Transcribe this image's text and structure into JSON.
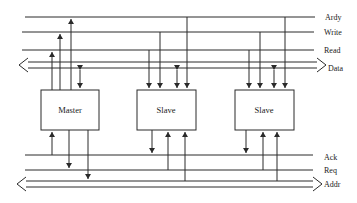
{
  "diagram": {
    "type": "bus-architecture",
    "signals": {
      "ardy": "Ardy",
      "write": "Write",
      "read": "Read",
      "data": "Data",
      "ack": "Ack",
      "req": "Req",
      "addr": "Addr"
    },
    "components": {
      "master": "Master",
      "slave1": "Slave",
      "slave2": "Slave"
    },
    "colors": {
      "stroke": "#2a2a2a",
      "background": "#ffffff"
    }
  }
}
